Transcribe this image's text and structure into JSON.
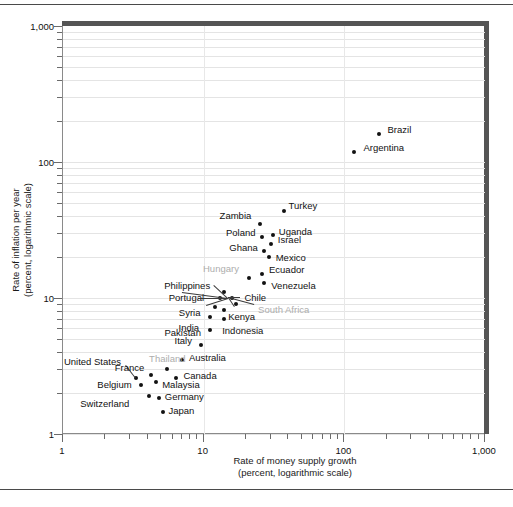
{
  "chart_data": {
    "type": "scatter",
    "title": "",
    "xlabel": "Rate of money supply growth (percent, logarithmic scale)",
    "xlabel_line1": "Rate of money supply growth",
    "xlabel_line2": "(percent, logarithmic scale)",
    "ylabel": "Rate of inflation per year (percent, logarithmic scale)",
    "ylabel_line1": "Rate of inflation per year",
    "ylabel_line2": "(percent, logarithmic scale)",
    "xscale": "log",
    "yscale": "log",
    "xlim": [
      1,
      1000
    ],
    "ylim": [
      1,
      1000
    ],
    "grid": "horizontal-log-minor, vertical-decades",
    "xticklabels": [
      "1",
      "10",
      "100",
      "1,000"
    ],
    "yticklabels": [
      "1",
      "10",
      "100",
      "1,000"
    ],
    "legend": "none",
    "points": [
      {
        "name": "Brazil",
        "x": 175,
        "y": 160,
        "label_dx": 9,
        "label_dy": -4,
        "gray": false
      },
      {
        "name": "Argentina",
        "x": 118,
        "y": 118,
        "label_dx": 9,
        "label_dy": -4,
        "gray": false
      },
      {
        "name": "Turkey",
        "x": 37,
        "y": 44,
        "label_dx": 5,
        "label_dy": -5,
        "gray": false
      },
      {
        "name": "Zambia",
        "x": 25,
        "y": 35,
        "label_dx": -40,
        "label_dy": -8,
        "gray": false
      },
      {
        "name": "Uganda",
        "x": 31,
        "y": 29,
        "label_dx": 6,
        "label_dy": -3,
        "gray": false
      },
      {
        "name": "Poland",
        "x": 26,
        "y": 28,
        "label_dx": -36,
        "label_dy": -4,
        "gray": false
      },
      {
        "name": "Israel",
        "x": 30,
        "y": 25,
        "label_dx": 7,
        "label_dy": -4,
        "gray": false
      },
      {
        "name": "Ghana",
        "x": 27,
        "y": 22,
        "label_dx": -35,
        "label_dy": -3,
        "gray": false
      },
      {
        "name": "Mexico",
        "x": 29,
        "y": 20,
        "label_dx": 7,
        "label_dy": 1,
        "gray": false
      },
      {
        "name": "Ecuador",
        "x": 26,
        "y": 15,
        "label_dx": 7,
        "label_dy": -4,
        "gray": false
      },
      {
        "name": "Venezuela",
        "x": 27,
        "y": 13,
        "label_dx": 7,
        "label_dy": 3,
        "gray": false
      },
      {
        "name": "Hungary",
        "x": 21,
        "y": 14,
        "label_dx": -46,
        "label_dy": -9,
        "gray": true
      },
      {
        "name": "Philippines",
        "x": 14,
        "y": 11,
        "label_dx": -60,
        "label_dy": -6,
        "gray": false
      },
      {
        "name": "Portugal",
        "x": 13,
        "y": 10,
        "label_dx": -51,
        "label_dy": 0,
        "gray": false
      },
      {
        "name": "Chile",
        "x": 16,
        "y": 10,
        "label_dx": 12,
        "label_dy": 0,
        "gray": false
      },
      {
        "name": "South Africa",
        "x": 17,
        "y": 9,
        "label_dx": 22,
        "label_dy": 6,
        "gray": true
      },
      {
        "name": "Syria",
        "x": 12,
        "y": 8.6,
        "label_dx": -36,
        "label_dy": 6,
        "gray": false
      },
      {
        "name": "Kenya",
        "x": 14,
        "y": 8.2,
        "label_dx": 4,
        "label_dy": 7,
        "gray": false
      },
      {
        "name": "India",
        "x": 11,
        "y": 7.2,
        "label_dx": -31,
        "label_dy": 11,
        "gray": false
      },
      {
        "name": "Indonesia",
        "x": 14,
        "y": 7.0,
        "label_dx": -2,
        "label_dy": 12,
        "gray": false
      },
      {
        "name": "Pakistan",
        "x": 11,
        "y": 5.8,
        "label_dx": -45,
        "label_dy": 3,
        "gray": false
      },
      {
        "name": "Italy",
        "x": 9.5,
        "y": 4.5,
        "label_dx": -26,
        "label_dy": -4,
        "gray": false
      },
      {
        "name": "Australia",
        "x": 7.0,
        "y": 3.5,
        "label_dx": 7,
        "label_dy": -2,
        "gray": false
      },
      {
        "name": "Thailand",
        "x": 5.5,
        "y": 3.0,
        "label_dx": -18,
        "label_dy": -10,
        "gray": true
      },
      {
        "name": "United States",
        "x": 3.3,
        "y": 2.6,
        "label_dx": -72,
        "label_dy": -16,
        "gray": false,
        "leader": true
      },
      {
        "name": "France",
        "x": 4.2,
        "y": 2.7,
        "label_dx": -36,
        "label_dy": -7,
        "gray": false
      },
      {
        "name": "Canada",
        "x": 6.4,
        "y": 2.6,
        "label_dx": 7,
        "label_dy": -2,
        "gray": false
      },
      {
        "name": "Belgium",
        "x": 3.6,
        "y": 2.3,
        "label_dx": -44,
        "label_dy": 0,
        "gray": false
      },
      {
        "name": "Malaysia",
        "x": 4.6,
        "y": 2.4,
        "label_dx": 6,
        "label_dy": 3,
        "gray": false
      },
      {
        "name": "Switzerland",
        "x": 4.1,
        "y": 1.9,
        "label_dx": -69,
        "label_dy": 8,
        "gray": false
      },
      {
        "name": "Germany",
        "x": 4.8,
        "y": 1.85,
        "label_dx": 6,
        "label_dy": -1,
        "gray": false
      },
      {
        "name": "Japan",
        "x": 5.1,
        "y": 1.45,
        "label_dx": 6,
        "label_dy": -1,
        "gray": false
      }
    ],
    "cluster_note": "dense overlapping cluster near x=12-17, y=9-11"
  }
}
